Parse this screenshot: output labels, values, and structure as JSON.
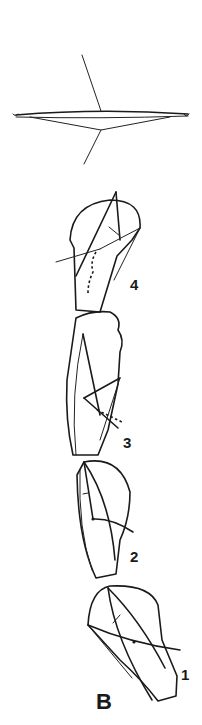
{
  "figure": {
    "panel_label": "B",
    "stage_labels": [
      "1",
      "2",
      "3",
      "4"
    ]
  }
}
